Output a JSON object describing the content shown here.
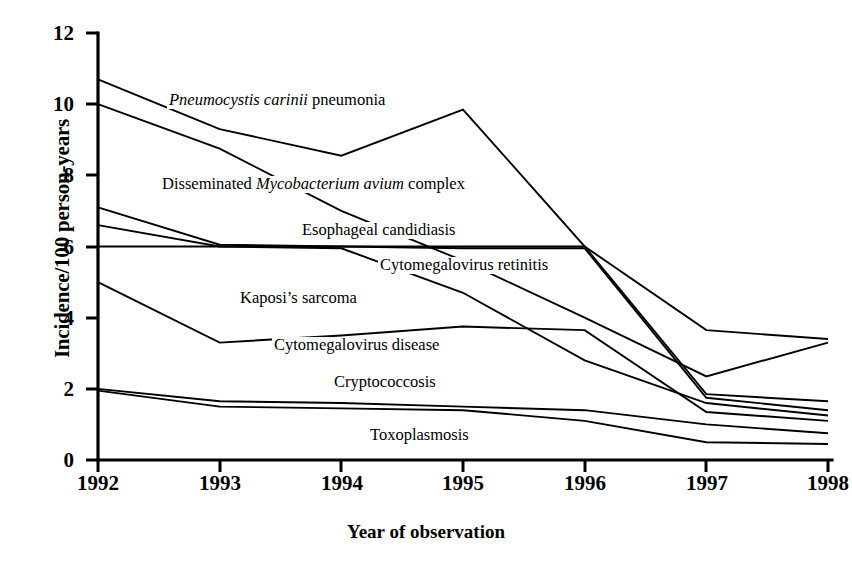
{
  "chart_data": {
    "type": "line",
    "title": "",
    "xlabel": "Year of observation",
    "ylabel": "Incidence/100 person-years",
    "x": [
      1992,
      1993,
      1994,
      1995,
      1996,
      1997,
      1998
    ],
    "xticklabels": [
      "1992",
      "1993",
      "1994",
      "1995",
      "1996",
      "1997",
      "1998"
    ],
    "yticklabels": [
      "0",
      "2",
      "4",
      "6",
      "8",
      "10",
      "12"
    ],
    "yticks": [
      0,
      2,
      4,
      6,
      8,
      10,
      12
    ],
    "xlim": [
      1992,
      1998
    ],
    "ylim": [
      0,
      12
    ],
    "grid": false,
    "legend": "inline-annotations",
    "line_color": "#000000",
    "series": [
      {
        "name": "Pneumocystis carinii pneumonia",
        "name_italic_part": "Pneumocystis carinii",
        "name_roman_part": "pneumonia",
        "values": [
          10.7,
          9.3,
          8.55,
          9.85,
          6.0,
          3.65,
          3.4
        ]
      },
      {
        "name": "Disseminated Mycobacterium avium complex",
        "name_roman_prefix": "Disseminated ",
        "name_italic_part": "Mycobacterium avium",
        "name_roman_suffix": " complex",
        "values": [
          10.0,
          8.75,
          7.0,
          5.6,
          4.0,
          2.35,
          3.3
        ]
      },
      {
        "name": "Esophageal candidiasis",
        "values": [
          7.1,
          6.05,
          6.0,
          5.95,
          5.95,
          1.75,
          1.4
        ]
      },
      {
        "name": "Cytomegalovirus retinitis",
        "values": [
          6.6,
          6.0,
          5.95,
          4.7,
          2.8,
          1.6,
          1.25
        ]
      },
      {
        "name": "Kaposi's sarcoma",
        "values": [
          6.0,
          6.0,
          6.0,
          6.0,
          6.0,
          1.85,
          1.65
        ]
      },
      {
        "name": "Cytomegalovirus disease",
        "values": [
          5.0,
          3.3,
          3.5,
          3.75,
          3.65,
          1.35,
          1.1
        ]
      },
      {
        "name": "Cryptococcosis",
        "values": [
          2.0,
          1.65,
          1.6,
          1.5,
          1.4,
          1.0,
          0.75
        ]
      },
      {
        "name": "Toxoplasmosis",
        "values": [
          1.95,
          1.5,
          1.45,
          1.4,
          1.1,
          0.5,
          0.45
        ]
      }
    ],
    "annotations": [
      {
        "id": "pcp",
        "x": 167,
        "y": 92
      },
      {
        "id": "mac",
        "x": 160,
        "y": 176
      },
      {
        "id": "esophageal",
        "x": 300,
        "y": 222
      },
      {
        "id": "cmv_retinitis",
        "x": 378,
        "y": 257
      },
      {
        "id": "kaposi",
        "x": 238,
        "y": 290
      },
      {
        "id": "cmv_disease",
        "x": 272,
        "y": 337
      },
      {
        "id": "cryptococcosis",
        "x": 332,
        "y": 374
      },
      {
        "id": "toxoplasmosis",
        "x": 368,
        "y": 427
      }
    ]
  },
  "labels": {
    "pcp_italic": "Pneumocystis carinii",
    "pcp_roman": " pneumonia",
    "mac_pre": "Disseminated ",
    "mac_italic": "Mycobacterium avium",
    "mac_post": " complex",
    "esophageal": "Esophageal candidiasis",
    "cmv_retinitis": "Cytomegalovirus retinitis",
    "kaposi": "Kaposi’s sarcoma",
    "cmv_disease": "Cytomegalovirus disease",
    "cryptococcosis": "Cryptococcosis",
    "toxoplasmosis": "Toxoplasmosis"
  },
  "axes": {
    "y_title": "Incidence/100 person-years",
    "x_title": "Year of observation",
    "yticks": [
      "12",
      "10",
      "8",
      "6",
      "4",
      "2",
      "0"
    ],
    "xticks": [
      "1992",
      "1993",
      "1994",
      "1995",
      "1996",
      "1997",
      "1998"
    ]
  }
}
